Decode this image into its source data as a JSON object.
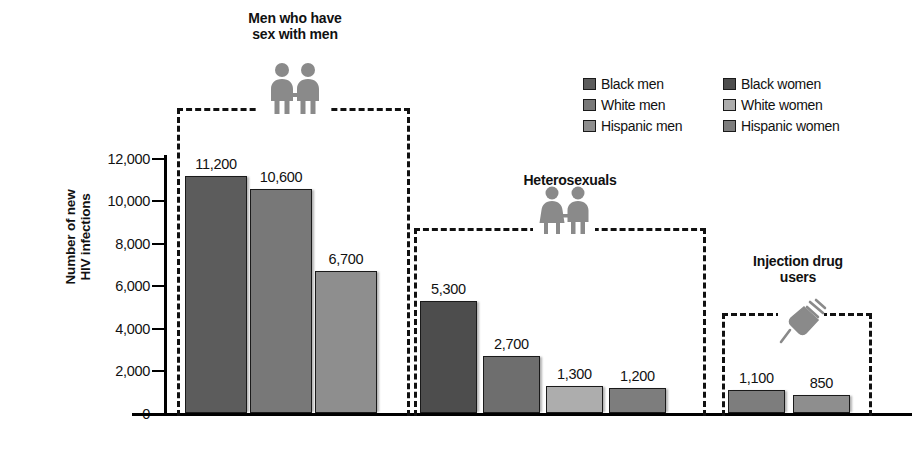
{
  "chart_data": {
    "type": "bar",
    "title": "",
    "xlabel": "",
    "ylabel": "Number of new\nHIV infections",
    "ylim": [
      0,
      12000
    ],
    "ytick_labels": [
      "0",
      "2,000",
      "4,000",
      "6,000",
      "8,000",
      "10,000",
      "12,000"
    ],
    "ytick_values": [
      0,
      2000,
      4000,
      6000,
      8000,
      10000,
      12000
    ],
    "grid": false,
    "legend_position": "top-right",
    "legend": [
      {
        "label": "Black men",
        "color": "#5c5c5c"
      },
      {
        "label": "White men",
        "color": "#787878"
      },
      {
        "label": "Hispanic men",
        "color": "#8e8e8e"
      },
      {
        "label": "Black women",
        "color": "#4d4d4d"
      },
      {
        "label": "White women",
        "color": "#adadad"
      },
      {
        "label": "Hispanic women",
        "color": "#7d7d7d"
      }
    ],
    "groups": [
      {
        "name": "Men who have\nsex with men",
        "icon": "two-men-holding-hands-icon",
        "bars": [
          {
            "category": "Black men",
            "value": 11200,
            "label": "11,200",
            "color": "#5c5c5c"
          },
          {
            "category": "White men",
            "value": 10600,
            "label": "10,600",
            "color": "#787878"
          },
          {
            "category": "Hispanic men",
            "value": 6700,
            "label": "6,700",
            "color": "#8e8e8e"
          }
        ]
      },
      {
        "name": "Heterosexuals",
        "icon": "woman-and-man-holding-hands-icon",
        "bars": [
          {
            "category": "Black women",
            "value": 5300,
            "label": "5,300",
            "color": "#4d4d4d"
          },
          {
            "category": "Black men",
            "value": 2700,
            "label": "2,700",
            "color": "#6e6e6e"
          },
          {
            "category": "White women",
            "value": 1300,
            "label": "1,300",
            "color": "#adadad"
          },
          {
            "category": "Hispanic women",
            "value": 1200,
            "label": "1,200",
            "color": "#7d7d7d"
          }
        ]
      },
      {
        "name": "Injection drug\nusers",
        "icon": "syringe-icon",
        "bars": [
          {
            "category": "Black men",
            "value": 1100,
            "label": "1,100",
            "color": "#7d7d7d"
          },
          {
            "category": "White men",
            "value": 850,
            "label": "850",
            "color": "#8e8e8e"
          }
        ]
      }
    ]
  },
  "axis": {
    "title": "Number of new\nHIV infections",
    "ticks": [
      "12,000",
      "10,000",
      "8,000",
      "6,000",
      "4,000",
      "2,000",
      "0"
    ]
  },
  "legend": {
    "left_column": [
      "Black men",
      "White men",
      "Hispanic men"
    ],
    "right_column": [
      "Black women",
      "White women",
      "Hispanic women"
    ]
  },
  "groups": {
    "g0": {
      "title": "Men who have\nsex with men"
    },
    "g1": {
      "title": "Heterosexuals"
    },
    "g2": {
      "title": "Injection drug\nusers"
    }
  },
  "bar_labels": {
    "b0": "11,200",
    "b1": "10,600",
    "b2": "6,700",
    "b3": "5,300",
    "b4": "2,700",
    "b5": "1,300",
    "b6": "1,200",
    "b7": "1,100",
    "b8": "850"
  }
}
